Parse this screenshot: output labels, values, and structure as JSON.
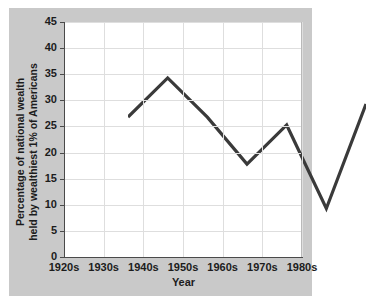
{
  "chart_data": {
    "type": "line",
    "title": "",
    "xlabel": "Year",
    "ylabel": "Percentage of national wealth held by wealthiest 1% of Americans",
    "ylabel_lines": [
      "Percentage of national wealth",
      "held by wealthiest 1% of Americans"
    ],
    "categories": [
      "1920s",
      "1930s",
      "1940s",
      "1950s",
      "1960s",
      "1970s",
      "1980s"
    ],
    "values": [
      31,
      38.5,
      31,
      22,
      29.5,
      13.5,
      33.5
    ],
    "series": [
      {
        "name": "Percentage of national wealth held by wealthiest 1% of Americans",
        "values": [
          31,
          38.5,
          31,
          22,
          29.5,
          13.5,
          33.5
        ]
      }
    ],
    "ylim": [
      0,
      45
    ],
    "ytick_labels": [
      "0",
      "5",
      "10",
      "15",
      "20",
      "25",
      "30",
      "35",
      "40",
      "45"
    ],
    "ytick_values": [
      0,
      5,
      10,
      15,
      20,
      25,
      30,
      35,
      40,
      45
    ],
    "xtick_labels": [
      "1920s",
      "1930s",
      "1940s",
      "1950s",
      "1960s",
      "1970s",
      "1980s"
    ],
    "grid": true,
    "legend": "none",
    "colors": {
      "line": "#3a3a3a",
      "plot_background": "#ffffff",
      "panel_background": "#c9c9c9",
      "gridline": "#dedede",
      "axis": "#4a4a4a",
      "text": "#1c1c1c"
    }
  }
}
